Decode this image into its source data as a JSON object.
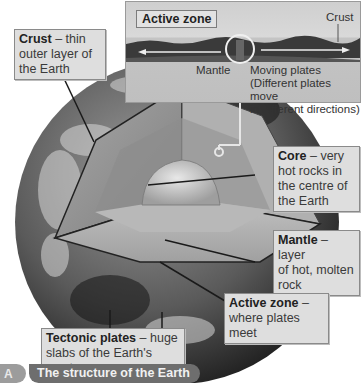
{
  "figure": {
    "caption_badge": "A",
    "caption": "The structure of the Earth"
  },
  "inset": {
    "title": "Active zone",
    "crust_label": "Crust",
    "mantle_label": "Mantle",
    "moving_plates_label": "Moving plates",
    "moving_plates_note_line1": "(Different plates move",
    "moving_plates_note_line2": "in different directions)"
  },
  "labels": {
    "crust": {
      "term": "Crust",
      "desc_line1": " – thin",
      "desc_line2": "outer layer of",
      "desc_line3": "the Earth"
    },
    "core": {
      "term": "Core",
      "desc_line1": " – very",
      "desc_line2": "hot rocks in",
      "desc_line3": "the centre of",
      "desc_line4": "the Earth"
    },
    "mantle": {
      "term": "Mantle",
      "desc_line1": " – layer",
      "desc_line2": "of hot, molten",
      "desc_line3": "rock"
    },
    "active_zone": {
      "term": "Active zone",
      "desc_line1": " –",
      "desc_line2": "where plates meet"
    },
    "tectonic_plates": {
      "term": "Tectonic plates",
      "desc_line1": " – huge",
      "desc_line2": "slabs of the Earth's crust"
    }
  },
  "colors": {
    "box_fill": "#dedede",
    "box_border": "#8a8a8a",
    "caption_fill": "#6e6e6e",
    "caption_badge": "#9c9c9c"
  }
}
